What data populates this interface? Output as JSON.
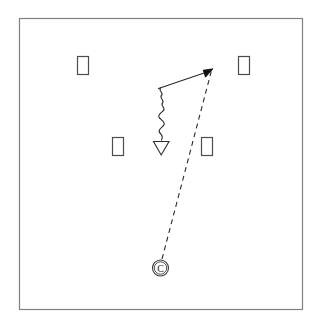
{
  "diagram": {
    "canvas": {
      "width": 322,
      "height": 331,
      "background": "#ffffff"
    },
    "court": {
      "name": "court-frame",
      "x": 19,
      "y": 18,
      "width": 283,
      "height": 291,
      "stroke": "#808080",
      "stroke_width": 1.2,
      "fill": "#ffffff"
    },
    "players": [
      {
        "id": "defender-top-left",
        "label": "",
        "shape": "rectangle",
        "x": 77,
        "y": 56,
        "width": 11,
        "height": 18,
        "stroke": "#4d4d4d",
        "fill": "#ffffff"
      },
      {
        "id": "defender-top-right",
        "label": "",
        "shape": "rectangle",
        "x": 238,
        "y": 56,
        "width": 11,
        "height": 18,
        "stroke": "#4d4d4d",
        "fill": "#ffffff"
      },
      {
        "id": "defender-mid-left",
        "label": "",
        "shape": "rectangle",
        "x": 112,
        "y": 137,
        "width": 11,
        "height": 18,
        "stroke": "#4d4d4d",
        "fill": "#ffffff"
      },
      {
        "id": "defender-mid-right",
        "label": "",
        "shape": "rectangle",
        "x": 201,
        "y": 137,
        "width": 11,
        "height": 18,
        "stroke": "#4d4d4d",
        "fill": "#ffffff"
      }
    ],
    "ball_handler": {
      "id": "ball-handler-c",
      "label": "C",
      "shape": "circled-letter",
      "cx": 160,
      "cy": 268,
      "r": 8,
      "inner_r": 6.2,
      "stroke": "#3a3a3a",
      "fill": "#ffffff",
      "text_color": "#2b2b2b",
      "font_size": 10
    },
    "paths": [
      {
        "id": "pass-path",
        "type": "dashed-line",
        "meaning": "pass",
        "from": {
          "x": 162,
          "y": 259
        },
        "to": {
          "x": 211,
          "y": 71
        },
        "stroke": "#2b2b2b",
        "stroke_width": 1.1,
        "dash": "5,4"
      },
      {
        "id": "dribble-path",
        "type": "wavy-line",
        "meaning": "dribble",
        "from": {
          "x": 161,
          "y": 88
        },
        "to": {
          "x": 161,
          "y": 140
        },
        "amplitude": 3.2,
        "wavelength": 9,
        "stroke": "#2b2b2b",
        "stroke_width": 1.1,
        "end_marker": "open-triangle-down"
      },
      {
        "id": "cut-path",
        "type": "solid-line",
        "meaning": "cut",
        "from": {
          "x": 158,
          "y": 88
        },
        "to": {
          "x": 209,
          "y": 71
        },
        "stroke": "#2b2b2b",
        "stroke_width": 1.2,
        "end_marker": "filled-arrowhead"
      }
    ],
    "markers": {
      "open_triangle": {
        "id": "screen-triangle-marker",
        "cx": 161,
        "cy": 148,
        "half_width": 7.5,
        "height": 13,
        "stroke": "#2b2b2b",
        "fill": "#ffffff"
      },
      "filled_arrowhead": {
        "id": "cut-arrowhead",
        "tip_x": 212,
        "tip_y": 70,
        "size": 8,
        "fill": "#111111"
      }
    }
  }
}
